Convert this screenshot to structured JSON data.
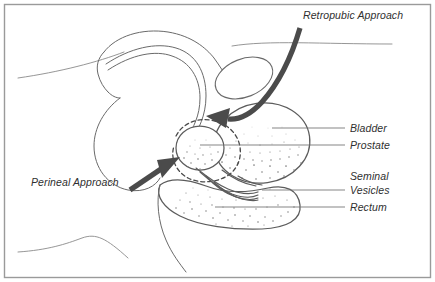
{
  "figure": {
    "background_color": "#ffffff",
    "border_color": "#9a9a9a",
    "ink_color": "#5c5c5c",
    "arrow_color": "#4b4b4b",
    "text_color": "#2f2f2f"
  },
  "approach_callouts": [
    {
      "id": "retropubic",
      "label": "Retropubic Approach",
      "arrow": "curved-down-left"
    },
    {
      "id": "perineal",
      "label": "Perineal Approach",
      "arrow": "straight-up-right"
    }
  ],
  "anatomy_labels": [
    {
      "id": "bladder",
      "label": "Bladder",
      "leader": "horizontal"
    },
    {
      "id": "prostate",
      "label": "Prostate",
      "leader": "horizontal"
    },
    {
      "id": "seminal-vesicles",
      "label_line1": "Seminal",
      "label_line2": "Vesicles",
      "leader": "horizontal"
    },
    {
      "id": "rectum",
      "label": "Rectum",
      "leader": "horizontal"
    }
  ],
  "structures": [
    {
      "id": "bladder",
      "name": "Bladder",
      "shading": "stippled-lower"
    },
    {
      "id": "prostate",
      "name": "Prostate",
      "shading": "stippled-lower"
    },
    {
      "id": "seminal-vesicles",
      "name": "Seminal Vesicles",
      "shading": "tubular-strokes"
    },
    {
      "id": "rectum",
      "name": "Rectum",
      "shading": "stippled"
    },
    {
      "id": "pubic-bone",
      "name": "Pubic Bone",
      "shading": "outline"
    },
    {
      "id": "urethra",
      "name": "Urethra",
      "shading": "double-line"
    },
    {
      "id": "penis",
      "name": "Penis",
      "shading": "outline"
    },
    {
      "id": "incision-margin",
      "name": "Incision Margin",
      "shading": "dashed"
    }
  ]
}
